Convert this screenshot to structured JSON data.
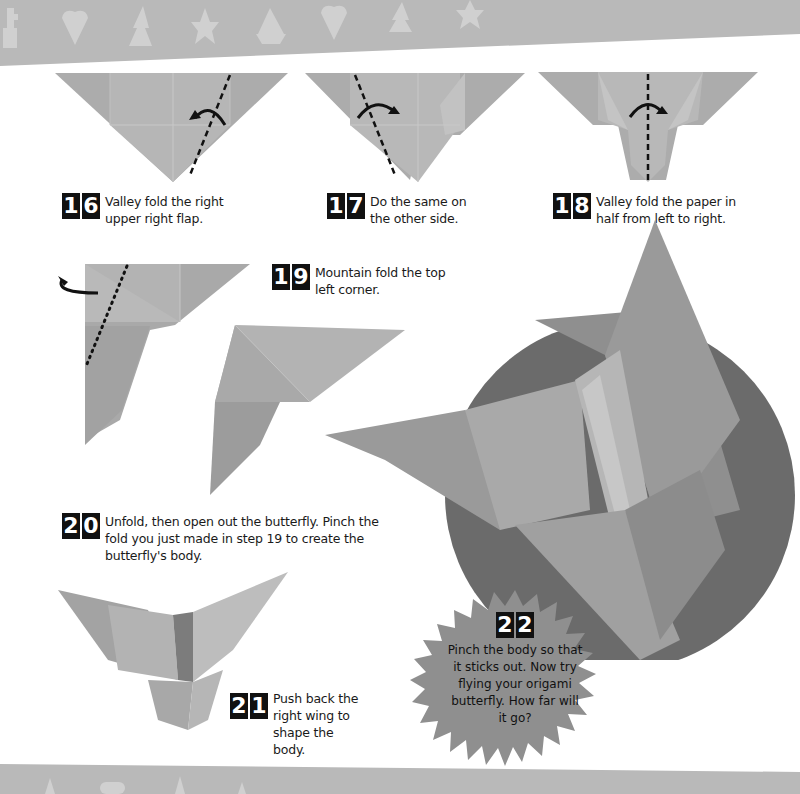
{
  "page": {
    "header_band": {
      "color": "#b9b9b9",
      "shape_color": "#d2d2d2",
      "shapes": [
        "flowerpot-icon",
        "heart-icon",
        "tree-icon",
        "star-icon",
        "boat-icon",
        "heart-icon",
        "tree-icon",
        "star-icon"
      ]
    },
    "footer_band": {
      "color": "#b9b9b9"
    },
    "steps": [
      {
        "number": [
          "1",
          "6"
        ],
        "text": "Valley fold the right upper right flap."
      },
      {
        "number": [
          "1",
          "7"
        ],
        "text": "Do the same on the other side."
      },
      {
        "number": [
          "1",
          "8"
        ],
        "text": "Valley fold the paper in half from left to right."
      },
      {
        "number": [
          "1",
          "9"
        ],
        "text": "Mountain fold the top left corner."
      },
      {
        "number": [
          "2",
          "0"
        ],
        "text": "Unfold, then open out the butterfly. Pinch the fold you just made in step 19 to create the butterfly's body."
      },
      {
        "number": [
          "2",
          "1"
        ],
        "text": "Push back the right wing to shape the body."
      },
      {
        "number": [
          "2",
          "2"
        ],
        "text": "Pinch the body so that it sticks out. Now try flying your origami butterfly. How far will it go?"
      }
    ],
    "colors": {
      "paper": "#a9a9a9",
      "paper_light": "#c4c4c4",
      "paper_dark": "#8e8e8e",
      "circle": "#6b6b6b",
      "burst": "#8f8f8f",
      "badge": "#111111"
    }
  }
}
